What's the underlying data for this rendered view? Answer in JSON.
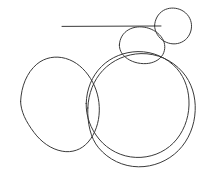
{
  "canvas": {
    "title": "Hand-drawn circles sketch",
    "width": 215,
    "height": 182,
    "background_color": "#ffffff",
    "stroke_color": "#3a3a3a",
    "stroke_width": 1
  },
  "chart_data": {
    "type": "scatter",
    "subtitle": "",
    "xlabel": "",
    "ylabel": "",
    "xlim": [
      0,
      215
    ],
    "ylim": [
      0,
      182
    ],
    "grid": false,
    "legend": "none",
    "tick_labels_x": [],
    "tick_labels_y": [],
    "annotations": [],
    "shapes": [
      {
        "name": "large-circle-left",
        "shape": "circle",
        "cx": 60,
        "cy": 104,
        "rx": 40,
        "ry": 47,
        "rotation": 0,
        "stroke": "#3a3a3a",
        "fill": "none"
      },
      {
        "name": "large-circle-outer-right",
        "shape": "circle",
        "cx": 141,
        "cy": 110,
        "rx": 54,
        "ry": 60,
        "rotation": 0,
        "stroke": "#3a3a3a",
        "fill": "none"
      },
      {
        "name": "large-circle-inner-right",
        "shape": "circle",
        "cx": 137,
        "cy": 105,
        "rx": 52,
        "ry": 56,
        "rotation": 0,
        "stroke": "#3a3a3a",
        "fill": "none"
      },
      {
        "name": "small-circle-middle",
        "shape": "circle",
        "cx": 142,
        "cy": 45,
        "rx": 23,
        "ry": 18,
        "rotation": 0,
        "stroke": "#3a3a3a",
        "fill": "none"
      },
      {
        "name": "small-circle-top-right",
        "shape": "circle",
        "cx": 172,
        "cy": 25,
        "rx": 18,
        "ry": 17,
        "rotation": 0,
        "stroke": "#3a3a3a",
        "fill": "none"
      }
    ],
    "lines": [
      {
        "name": "horizontal-line",
        "shape": "line",
        "x1": 62,
        "y1": 26,
        "x2": 161,
        "y2": 26,
        "stroke": "#3a3a3a"
      }
    ]
  }
}
